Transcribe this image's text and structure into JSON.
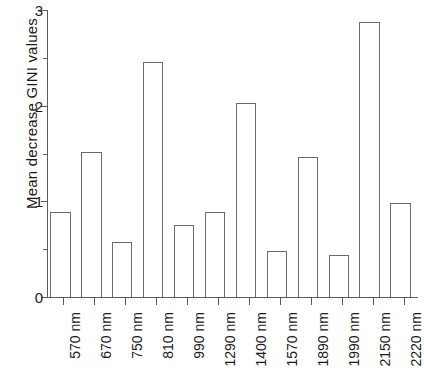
{
  "chart_data": {
    "type": "bar",
    "title": "",
    "subtitle": "",
    "xlabel": "",
    "ylabel": "Mean decrease GINI values",
    "categories": [
      "570 nm",
      "670 nm",
      "750 nm",
      "810 nm",
      "990 nm",
      "1290 nm",
      "1400 nm",
      "1570 nm",
      "1890 nm",
      "1990 nm",
      "2150 nm",
      "2220 nm"
    ],
    "values": [
      0.89,
      1.52,
      0.58,
      2.46,
      0.75,
      0.89,
      2.03,
      0.48,
      1.46,
      0.44,
      2.87,
      0.98
    ],
    "ylim": [
      0,
      3
    ],
    "xlim_index": [
      0,
      12
    ],
    "ytick_labels": [
      "0",
      "1",
      "2",
      "3"
    ],
    "ytick_values": [
      0,
      1,
      2,
      3
    ],
    "yminor_tick_values": [
      0.5,
      1.5,
      2.5
    ],
    "grid": false,
    "legend": null,
    "legend_position": "none",
    "bar_facecolor": "#ffffff",
    "bar_edgecolor": "#6b6b6b",
    "axis_color": "#5a5a5a",
    "text_color": "#1a1a1a",
    "background": "#ffffff",
    "xtick_label_rotation": -90
  }
}
